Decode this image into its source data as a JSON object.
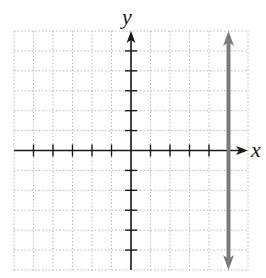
{
  "chart_data": {
    "type": "line",
    "title": "",
    "xlabel": "x",
    "ylabel": "y",
    "xlim": [
      -6,
      6
    ],
    "ylim": [
      -6,
      6
    ],
    "grid": true,
    "x_ticks": [
      -5,
      -4,
      -3,
      -2,
      -1,
      1,
      2,
      3,
      4,
      5
    ],
    "y_ticks": [
      -5,
      -4,
      -3,
      -2,
      -1,
      1,
      2,
      3,
      4,
      5
    ],
    "tick_labels_shown": false,
    "series": [
      {
        "name": "vertical line x = 5",
        "kind": "vertical_line",
        "x": 5,
        "y_range": [
          -6,
          6
        ],
        "arrows": "both",
        "color": "#7a7a7a"
      }
    ]
  },
  "labels": {
    "x_axis": "x",
    "y_axis": "y"
  },
  "colors": {
    "axis": "#1a1a1a",
    "grid": "#b8b8b8",
    "line": "#7a7a7a"
  }
}
